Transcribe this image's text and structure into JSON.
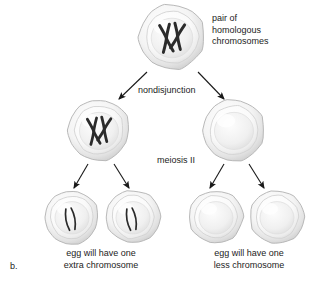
{
  "figure": {
    "panel_label": "b.",
    "background_color": "#ffffff",
    "text_color": "#1c1c1c",
    "cell_outline_color": "#b9b9b9",
    "chromosome_color": "#2b2b2b"
  },
  "labels": {
    "homologous": "pair of\nhomologous\nchromosomes",
    "nondisjunction": "nondisjunction",
    "meiosis_two": "meiosis II",
    "caption_left": "egg will have one\nextra chromosome",
    "caption_right": "egg will have one\nless chromosome"
  },
  "cells": [
    {
      "id": "parent-cell",
      "row": "top",
      "cx": 172,
      "cy": 37,
      "r": 33,
      "has_chromosomes": true,
      "chromosome_style": "paired-x",
      "chromosome_count": 2
    },
    {
      "id": "secondary-oocyte-left",
      "row": "middle",
      "cx": 99,
      "cy": 130,
      "r": 31,
      "has_chromosomes": true,
      "chromosome_style": "paired-x",
      "chromosome_count": 2
    },
    {
      "id": "secondary-oocyte-right",
      "row": "middle",
      "cx": 234,
      "cy": 130,
      "r": 31,
      "has_chromosomes": false,
      "chromosome_style": "none",
      "chromosome_count": 0
    },
    {
      "id": "gamete-1",
      "row": "bottom",
      "cx": 72,
      "cy": 217,
      "r": 27,
      "has_chromosomes": true,
      "chromosome_style": "single-curved",
      "chromosome_count": 1
    },
    {
      "id": "gamete-2",
      "row": "bottom",
      "cx": 133,
      "cy": 217,
      "r": 27,
      "has_chromosomes": true,
      "chromosome_style": "single-curved",
      "chromosome_count": 1
    },
    {
      "id": "gamete-3",
      "row": "bottom",
      "cx": 216,
      "cy": 217,
      "r": 27,
      "has_chromosomes": false,
      "chromosome_style": "none",
      "chromosome_count": 0
    },
    {
      "id": "gamete-4",
      "row": "bottom",
      "cx": 277,
      "cy": 217,
      "r": 27,
      "has_chromosomes": false,
      "chromosome_style": "none",
      "chromosome_count": 0
    }
  ],
  "arrows": [
    {
      "id": "arrow-parent-to-left",
      "x1": 147,
      "y1": 72,
      "x2": 119,
      "y2": 99
    },
    {
      "id": "arrow-parent-to-right",
      "x1": 198,
      "y1": 72,
      "x2": 224,
      "y2": 99
    },
    {
      "id": "arrow-left-to-g1",
      "x1": 88,
      "y1": 164,
      "x2": 74,
      "y2": 188
    },
    {
      "id": "arrow-left-to-g2",
      "x1": 114,
      "y1": 164,
      "x2": 129,
      "y2": 188
    },
    {
      "id": "arrow-right-to-g3",
      "x1": 224,
      "y1": 164,
      "x2": 210,
      "y2": 188
    },
    {
      "id": "arrow-right-to-g4",
      "x1": 249,
      "y1": 164,
      "x2": 264,
      "y2": 188
    }
  ]
}
